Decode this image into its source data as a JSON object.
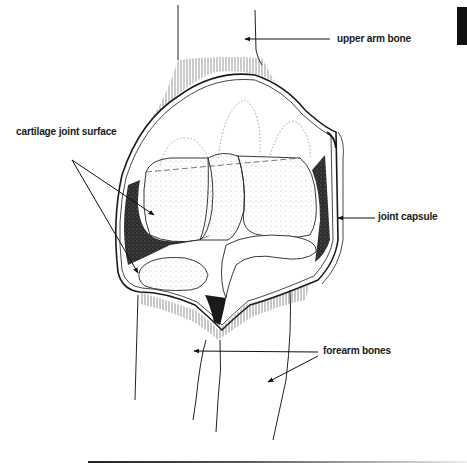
{
  "figure": {
    "labels": {
      "upper_arm_bone": "upper arm bone",
      "cartilage_joint_surface": "cartilage joint surface",
      "joint_capsule": "joint capsule",
      "forearm_bones": "forearm bones"
    },
    "colors": {
      "ink": "#1a1a1a",
      "background": "#ffffff",
      "shade": "#2b2b2b"
    }
  }
}
